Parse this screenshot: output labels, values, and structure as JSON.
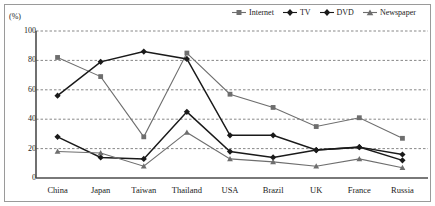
{
  "chart_data": {
    "type": "line",
    "title": "",
    "subtitle": "",
    "xlabel": "",
    "ylabel": "(%)",
    "unit_label": "(%)",
    "ylim": [
      0,
      100
    ],
    "yticks": [
      0,
      20,
      40,
      60,
      80,
      100
    ],
    "grid": "horizontal-dashed",
    "legend_position": "top-right",
    "categories": [
      "China",
      "Japan",
      "Taiwan",
      "Thailand",
      "USA",
      "Brazil",
      "UK",
      "France",
      "Russia"
    ],
    "series": [
      {
        "name": "Internet",
        "marker": "square",
        "color": "#6e6e6e",
        "values": [
          82,
          69,
          28,
          85,
          57,
          48,
          35,
          41,
          27
        ]
      },
      {
        "name": "TV",
        "marker": "diamond",
        "color": "#1a1a1a",
        "values": [
          56,
          79,
          86,
          81,
          29,
          29,
          19,
          21,
          16
        ]
      },
      {
        "name": "DVD",
        "marker": "diamond",
        "color": "#1a1a1a",
        "values": [
          28,
          14,
          13,
          45,
          18,
          14,
          19,
          21,
          12
        ]
      },
      {
        "name": "Newspaper",
        "marker": "triangle",
        "color": "#6e6e6e",
        "values": [
          18,
          17,
          8,
          31,
          13,
          11,
          8,
          13,
          7
        ]
      }
    ]
  },
  "legend": {
    "items": [
      {
        "label": "Internet",
        "marker": "square",
        "color": "#6e6e6e"
      },
      {
        "label": "TV",
        "marker": "diamond",
        "color": "#1a1a1a"
      },
      {
        "label": "DVD",
        "marker": "diamond",
        "color": "#1a1a1a"
      },
      {
        "label": "Newspaper",
        "marker": "triangle",
        "color": "#6e6e6e"
      }
    ]
  },
  "axis": {
    "y_unit": "(%)",
    "y_tick_labels": [
      "100",
      "80",
      "60",
      "40",
      "20",
      "0"
    ],
    "x_tick_labels": [
      "China",
      "Japan",
      "Taiwan",
      "Thailand",
      "USA",
      "Brazil",
      "UK",
      "France",
      "Russia"
    ]
  },
  "colors": {
    "axis": "#4d4d4d",
    "grid": "#555555",
    "frame": "#9a9a9a",
    "dark_series": "#1a1a1a",
    "gray_series": "#6e6e6e",
    "background": "#ffffff"
  }
}
